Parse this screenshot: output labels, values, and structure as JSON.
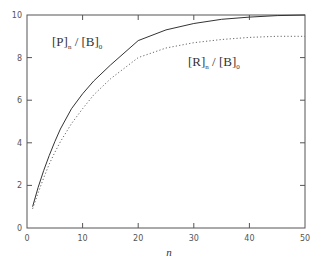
{
  "chart_data": {
    "type": "line",
    "title": "",
    "xlabel": "n",
    "ylabel": "",
    "xlim": [
      0,
      50
    ],
    "ylim": [
      0,
      10
    ],
    "grid": false,
    "legend": "inline-annotations",
    "x_ticks": [
      0,
      10,
      20,
      30,
      40,
      50
    ],
    "y_ticks": [
      0,
      2,
      4,
      6,
      8,
      10
    ],
    "x": [
      1,
      2,
      3,
      4,
      5,
      6,
      8,
      10,
      12,
      15,
      20,
      25,
      30,
      35,
      40,
      45,
      50
    ],
    "series": [
      {
        "name": "[P]n / [B]0",
        "style": "solid",
        "values": [
          1.0,
          1.9,
          2.7,
          3.4,
          4.05,
          4.65,
          5.6,
          6.3,
          6.9,
          7.65,
          8.8,
          9.3,
          9.6,
          9.8,
          9.9,
          9.97,
          10.0
        ]
      },
      {
        "name": "[R]n / [B]0",
        "style": "dotted",
        "values": [
          0.9,
          1.65,
          2.35,
          3.0,
          3.55,
          4.05,
          4.9,
          5.6,
          6.25,
          7.0,
          8.0,
          8.45,
          8.7,
          8.85,
          8.95,
          9.0,
          9.0
        ]
      }
    ],
    "annotations": [
      {
        "text": "[P]n / [B]0",
        "main1": "[P]",
        "sub1": "n",
        "sep": " / ",
        "main2": "[B]",
        "sub2": "0"
      },
      {
        "text": "[R]n / [B]0",
        "main1": "[R]",
        "sub1": "n",
        "sep": " / ",
        "main2": "[B]",
        "sub2": "0"
      }
    ]
  },
  "labels": {
    "x_axis": "n",
    "x_ticks": [
      "0",
      "10",
      "20",
      "30",
      "40",
      "50"
    ],
    "y_ticks": [
      "0",
      "2",
      "4",
      "6",
      "8",
      "10"
    ]
  },
  "colors": {
    "frame": "#555555",
    "solid_line": "#333333",
    "dotted_line": "#555555"
  }
}
